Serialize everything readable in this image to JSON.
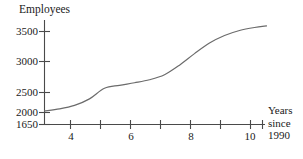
{
  "chart_data": {
    "type": "line",
    "title": "",
    "ylabel": "Employees",
    "xlabel": "Years since 1990",
    "xlabel_lines": [
      "Years",
      "since",
      "1990"
    ],
    "xlim": [
      3,
      10.4
    ],
    "ylim": [
      1650,
      3700
    ],
    "grid": false,
    "legend": null,
    "y_ticks": [
      1650,
      2000,
      2500,
      3000,
      3500
    ],
    "y_tick_labels": [
      "1650",
      "2000",
      "2500",
      "3000",
      "3500"
    ],
    "x_ticks": [
      3,
      4,
      5,
      6,
      7,
      8,
      9,
      10
    ],
    "x_tick_labels": [
      "",
      "4",
      "",
      "6",
      "",
      "8",
      "",
      "10"
    ],
    "x_labeled_ticks": [
      {
        "value": 4,
        "label": "4"
      },
      {
        "value": 6,
        "label": "6"
      },
      {
        "value": 8,
        "label": "8"
      },
      {
        "value": 10,
        "label": "10"
      }
    ],
    "line_color": "#6b6b6b",
    "axis_color": "#4a4a4a",
    "series": [
      {
        "name": "Employees",
        "x": [
          3.0,
          3.5,
          4.0,
          4.5,
          5.0,
          5.5,
          6.0,
          6.5,
          7.0,
          7.5,
          8.0,
          8.5,
          9.0,
          9.5,
          10.0,
          10.4
        ],
        "y": [
          1920,
          1960,
          2030,
          2160,
          2370,
          2430,
          2480,
          2540,
          2640,
          2830,
          3060,
          3270,
          3420,
          3520,
          3580,
          3610
        ]
      }
    ]
  }
}
